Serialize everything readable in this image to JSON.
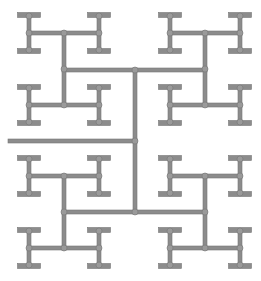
{
  "diagram": {
    "type": "H-tree fractal",
    "stroke_color": "#8c8c8c",
    "edge_color": "#777777",
    "joint_color": "#9a9a9a",
    "background": "#ffffff",
    "line_width": 4,
    "cap_thickness": 5,
    "cap_half_width": 11.5,
    "stem_half_height": 18,
    "root": {
      "x1": 8,
      "y": 141,
      "x2": 135
    },
    "trunk": {
      "x": 135,
      "y1": 70,
      "y2": 212
    },
    "level2_bars": [
      {
        "y": 70,
        "x1": 64,
        "x2": 205
      },
      {
        "y": 212,
        "x1": 64,
        "x2": 205
      }
    ],
    "level2_verticals": [
      {
        "x": 64,
        "y1": 33,
        "y2": 105
      },
      {
        "x": 205,
        "y1": 33,
        "y2": 105
      },
      {
        "x": 64,
        "y1": 176,
        "y2": 248
      },
      {
        "x": 205,
        "y1": 176,
        "y2": 248
      }
    ],
    "level3_bars": [
      {
        "y": 33,
        "x1": 29,
        "x2": 99
      },
      {
        "y": 105,
        "x1": 29,
        "x2": 99
      },
      {
        "y": 33,
        "x1": 170,
        "x2": 240
      },
      {
        "y": 105,
        "x1": 170,
        "x2": 240
      },
      {
        "y": 176,
        "x1": 29,
        "x2": 99
      },
      {
        "y": 248,
        "x1": 29,
        "x2": 99
      },
      {
        "y": 176,
        "x1": 170,
        "x2": 240
      },
      {
        "y": 248,
        "x1": 170,
        "x2": 240
      }
    ],
    "i_beams": [
      {
        "x": 29,
        "y": 33
      },
      {
        "x": 99,
        "y": 33
      },
      {
        "x": 170,
        "y": 33
      },
      {
        "x": 240,
        "y": 33
      },
      {
        "x": 29,
        "y": 105
      },
      {
        "x": 99,
        "y": 105
      },
      {
        "x": 170,
        "y": 105
      },
      {
        "x": 240,
        "y": 105
      },
      {
        "x": 29,
        "y": 176
      },
      {
        "x": 99,
        "y": 176
      },
      {
        "x": 170,
        "y": 176
      },
      {
        "x": 240,
        "y": 176
      },
      {
        "x": 29,
        "y": 248
      },
      {
        "x": 99,
        "y": 248
      },
      {
        "x": 170,
        "y": 248
      },
      {
        "x": 240,
        "y": 248
      }
    ]
  }
}
